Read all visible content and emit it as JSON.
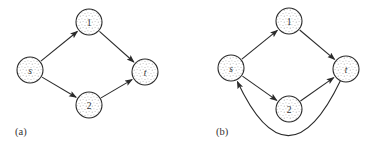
{
  "figure": {
    "captions": {
      "a": "(a)",
      "b": "(b)"
    }
  },
  "diagram": {
    "type": "directed-graph",
    "node_radius": 13,
    "colors": {
      "stroke": "#2b2b2b",
      "stipple_dot": "#b8b8b8",
      "node_fill": "#ffffff",
      "background": "#ffffff",
      "label_text": "#333333"
    },
    "graphs": [
      {
        "id": "a",
        "caption": "(a)",
        "nodes": [
          {
            "id": "s",
            "label": "s",
            "italic": true,
            "x": 30,
            "y": 70
          },
          {
            "id": "1",
            "label": "1",
            "italic": false,
            "x": 89,
            "y": 22
          },
          {
            "id": "t",
            "label": "t",
            "italic": true,
            "x": 145,
            "y": 72
          },
          {
            "id": "2",
            "label": "2",
            "italic": false,
            "x": 89,
            "y": 105
          }
        ],
        "edges": [
          {
            "from": "s",
            "to": "1"
          },
          {
            "from": "s",
            "to": "2"
          },
          {
            "from": "1",
            "to": "t"
          },
          {
            "from": "2",
            "to": "t"
          }
        ]
      },
      {
        "id": "b",
        "caption": "(b)",
        "nodes": [
          {
            "id": "s",
            "label": "s",
            "italic": true,
            "x": 231,
            "y": 68
          },
          {
            "id": "1",
            "label": "1",
            "italic": false,
            "x": 289,
            "y": 21
          },
          {
            "id": "t",
            "label": "t",
            "italic": true,
            "x": 346,
            "y": 69
          },
          {
            "id": "2",
            "label": "2",
            "italic": false,
            "x": 289,
            "y": 109
          }
        ],
        "edges": [
          {
            "from": "s",
            "to": "1"
          },
          {
            "from": "s",
            "to": "2"
          },
          {
            "from": "1",
            "to": "t"
          },
          {
            "from": "2",
            "to": "t"
          },
          {
            "from": "t",
            "to": "s",
            "curve_ctrl": [
              288,
              190
            ]
          }
        ]
      }
    ]
  }
}
